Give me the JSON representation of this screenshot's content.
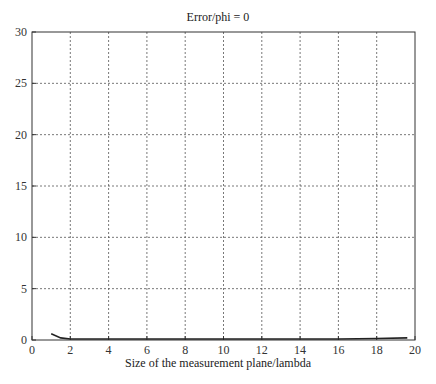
{
  "chart_data": {
    "type": "line",
    "title": "Error/phi = 0",
    "xlabel": "Size of the measurement plane/lambda",
    "ylabel": "",
    "xlim": [
      0,
      20
    ],
    "ylim": [
      0,
      30
    ],
    "xticks": [
      0,
      2,
      4,
      6,
      8,
      10,
      12,
      14,
      16,
      18,
      20
    ],
    "yticks": [
      0,
      5,
      10,
      15,
      20,
      25,
      30
    ],
    "grid": true,
    "legend": null,
    "series": [
      {
        "name": "error",
        "x": [
          1,
          1.5,
          2,
          4,
          6,
          8,
          10,
          12,
          14,
          16,
          18,
          19.6
        ],
        "y": [
          0.6,
          0.2,
          0.1,
          0.1,
          0.1,
          0.1,
          0.1,
          0.1,
          0.1,
          0.1,
          0.15,
          0.2
        ]
      }
    ]
  }
}
